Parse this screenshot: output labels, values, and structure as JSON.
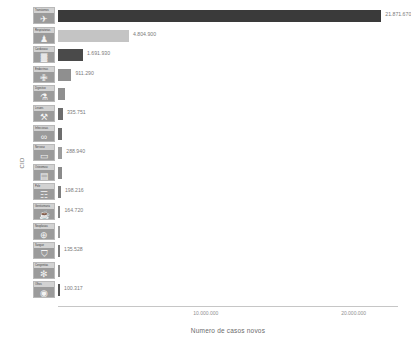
{
  "chart_data": {
    "type": "bar",
    "orientation": "horizontal",
    "title": "",
    "xlabel": "Numero de casos novos",
    "ylabel": "CID",
    "xlim": [
      0,
      23000000
    ],
    "grid": false,
    "legend": false,
    "x_ticks": [
      {
        "value": 10000000,
        "label": "10.000.000"
      },
      {
        "value": 20000000,
        "label": "20.000.000"
      }
    ],
    "categories": [
      "Transtornos mentais",
      "Doencas respiratorias",
      "Doencas cardiovasculares",
      "Doencas endocrinas",
      "Doencas do aparelho digestivo",
      "Lesoes e traumas",
      "Doencas infecciosas",
      "Doencas do sistema nervoso",
      "Doencas osteomusculares",
      "Doencas da pele",
      "Doencas geniturinarias",
      "Neoplasias",
      "Doencas do sangue",
      "Malformacoes congenitas",
      "Doencas dos olhos"
    ],
    "values": [
      21871670,
      4804900,
      1691930,
      911290,
      480000,
      335751,
      300000,
      288940,
      240000,
      198216,
      164720,
      150000,
      135528,
      115000,
      100317
    ],
    "value_labels": [
      "21.871.670",
      "4.804.900",
      "1.691.930",
      "911.290",
      "",
      "335.751",
      "",
      "288.940",
      "",
      "198.216",
      "164.720",
      "",
      "135.528",
      "",
      "100.317"
    ],
    "bar_colors": [
      "#3a3a3a",
      "#c4c4c4",
      "#4a4a4a",
      "#8f8f8f",
      "#8f8f8f",
      "#6d6d6d",
      "#6d6d6d",
      "#9c9c9c",
      "#8a8a8a",
      "#7e7e7e",
      "#848484",
      "#9a9a9a",
      "#7a7a7a",
      "#8d8d8d",
      "#555555"
    ],
    "category_icons": [
      {
        "name": "airplane-icon",
        "glyph": "✈",
        "caption": "Transtornos"
      },
      {
        "name": "person-icon",
        "glyph": "♟",
        "caption": "Respiratorias"
      },
      {
        "name": "chart-icon",
        "glyph": "▓",
        "caption": "Cardiovasc"
      },
      {
        "name": "compass-icon",
        "glyph": "✙",
        "caption": "Endocrinas"
      },
      {
        "name": "flask-icon",
        "glyph": "⚗",
        "caption": "Digestivo"
      },
      {
        "name": "injection-icon",
        "glyph": "⚒",
        "caption": "Lesoes"
      },
      {
        "name": "glasses-icon",
        "glyph": "∞",
        "caption": "Infecciosas"
      },
      {
        "name": "bed-icon",
        "glyph": "▭",
        "caption": "Nervoso"
      },
      {
        "name": "book-icon",
        "glyph": "▤",
        "caption": "Osteomusc"
      },
      {
        "name": "people-icon",
        "glyph": "☶",
        "caption": "Pele"
      },
      {
        "name": "cup-icon",
        "glyph": "☕",
        "caption": "Geniturinaria"
      },
      {
        "name": "pill-icon",
        "glyph": "⊕",
        "caption": "Neoplasias"
      },
      {
        "name": "shield-icon",
        "glyph": "⛉",
        "caption": "Sangue"
      },
      {
        "name": "virus-icon",
        "glyph": "✻",
        "caption": "Congenitas"
      },
      {
        "name": "eye-icon",
        "glyph": "◉",
        "caption": "Olhos"
      }
    ]
  }
}
